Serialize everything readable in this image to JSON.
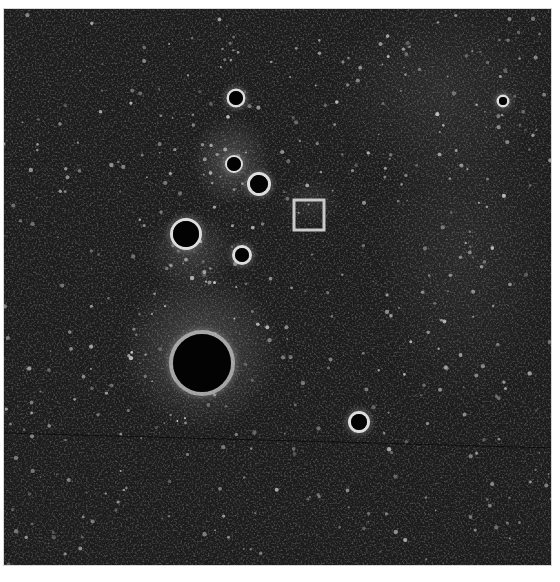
{
  "image": {
    "description": "Grayscale fluorescence-style micrograph with dark circular voids and a small square marker",
    "background_color": "#0b0b0b",
    "frame": {
      "x": 3,
      "y": 8,
      "width": 549,
      "height": 558
    },
    "holes": [
      {
        "cx": 235,
        "cy": 97,
        "r": 7,
        "ring": 2.5,
        "type": "ringed"
      },
      {
        "cx": 233,
        "cy": 163,
        "r": 7,
        "ring": 2,
        "type": "small-dark"
      },
      {
        "cx": 258,
        "cy": 183,
        "r": 9,
        "ring": 3,
        "type": "ringed"
      },
      {
        "cx": 185,
        "cy": 233,
        "r": 13,
        "ring": 3,
        "type": "ringed"
      },
      {
        "cx": 241,
        "cy": 254,
        "r": 7,
        "ring": 3,
        "type": "ringed"
      },
      {
        "cx": 201,
        "cy": 362,
        "r": 29,
        "ring": 4,
        "type": "large-dark"
      },
      {
        "cx": 358,
        "cy": 421,
        "r": 8,
        "ring": 3,
        "type": "ringed"
      },
      {
        "cx": 502,
        "cy": 100,
        "r": 4,
        "ring": 2.5,
        "type": "ringed"
      }
    ],
    "marker": {
      "x": 293,
      "y": 199,
      "width": 30,
      "height": 30,
      "stroke": "#c9c9c9",
      "stroke_width": 3
    },
    "glow_regions": [
      {
        "cx": 230,
        "cy": 160,
        "rx": 40,
        "ry": 45,
        "opacity": 0.35
      },
      {
        "cx": 200,
        "cy": 350,
        "rx": 80,
        "ry": 80,
        "opacity": 0.35
      },
      {
        "cx": 190,
        "cy": 250,
        "rx": 45,
        "ry": 40,
        "opacity": 0.25
      },
      {
        "cx": 440,
        "cy": 90,
        "rx": 110,
        "ry": 90,
        "opacity": 0.12
      },
      {
        "cx": 460,
        "cy": 250,
        "rx": 90,
        "ry": 160,
        "opacity": 0.1
      },
      {
        "cx": 310,
        "cy": 200,
        "rx": 30,
        "ry": 25,
        "opacity": 0.15
      }
    ]
  }
}
